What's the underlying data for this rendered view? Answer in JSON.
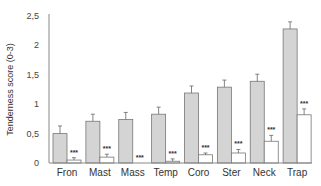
{
  "chart_data": {
    "type": "bar",
    "title": "",
    "xlabel": "",
    "ylabel": "Tenderness score (0-3)",
    "ylim": [
      0,
      2.5
    ],
    "yticks": [
      "0",
      "0,5",
      "1",
      "1,5",
      "2",
      "2,5"
    ],
    "grid": false,
    "categories": [
      "Fron",
      "Mast",
      "Mass",
      "Temp",
      "Coro",
      "Ster",
      "Neck",
      "Trap"
    ],
    "series": [
      {
        "name": "Group A (gray)",
        "color": "#d4d4d4",
        "values": [
          0.5,
          0.71,
          0.74,
          0.83,
          1.19,
          1.29,
          1.39,
          2.28
        ],
        "errors": [
          0.13,
          0.12,
          0.12,
          0.12,
          0.12,
          0.12,
          0.12,
          0.12
        ]
      },
      {
        "name": "Group B (white)",
        "color": "#ffffff",
        "values": [
          0.05,
          0.1,
          0.0,
          0.03,
          0.14,
          0.17,
          0.37,
          0.82
        ],
        "errors": [
          0.04,
          0.05,
          0.0,
          0.04,
          0.03,
          0.06,
          0.1,
          0.1
        ]
      }
    ],
    "annotations": [
      "***",
      "***",
      "***",
      "***",
      "***",
      "***",
      "***",
      "***"
    ],
    "legend": "none"
  }
}
